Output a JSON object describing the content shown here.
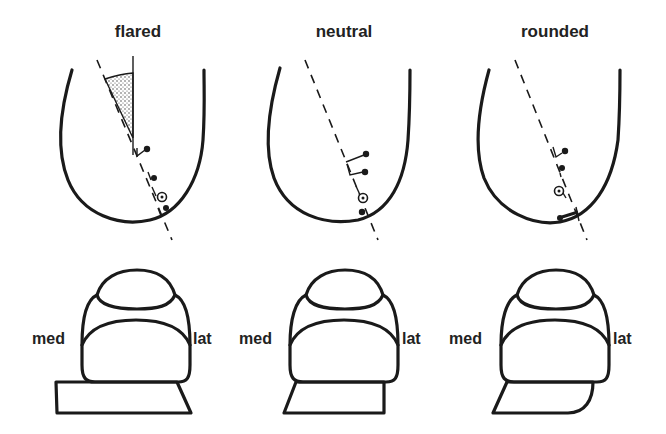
{
  "figure": {
    "panels": [
      {
        "id": "flared",
        "title": "flared",
        "medial_label": "med",
        "lateral_label": "lat",
        "base_shape": "trapezoid-flared"
      },
      {
        "id": "neutral",
        "title": "neutral",
        "medial_label": "med",
        "lateral_label": "lat",
        "base_shape": "trapezoid-straight-lateral"
      },
      {
        "id": "rounded",
        "title": "rounded",
        "medial_label": "med",
        "lateral_label": "lat",
        "base_shape": "trapezoid-rounded-lateral"
      }
    ],
    "colors": {
      "background": "#ffffff",
      "stroke": "#1a1a1a",
      "stipple": "#888888"
    }
  }
}
